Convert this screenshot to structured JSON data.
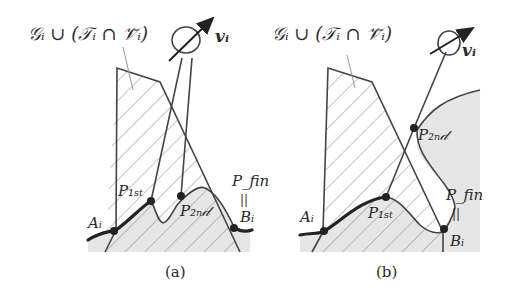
{
  "figure": {
    "panels": [
      {
        "id": "a",
        "caption": "(a)",
        "set_label": "𝒢ᵢ ∪ (𝒯ᵢ ∩ 𝒱̄ᵢ)",
        "velocity_label": "vᵢ",
        "points": {
          "A": "Aᵢ",
          "P1": "P₁ₛₜ",
          "P2": "P₂ₙ𝒹",
          "Pfin": "P_fin",
          "eq": "||",
          "B": "Bᵢ"
        }
      },
      {
        "id": "b",
        "caption": "(b)",
        "set_label": "𝒢ᵢ ∪ (𝒯ᵢ ∩ 𝒱̄ᵢ)",
        "velocity_label": "vᵢ",
        "points": {
          "A": "Aᵢ",
          "P1": "P₁ₛₜ",
          "P2": "P₂ₙ𝒹",
          "Pfin": "P_fin",
          "eq": "||",
          "B": "Bᵢ"
        }
      }
    ],
    "colors": {
      "shade": "#e4e4e4",
      "line": "#333333",
      "background": "#ffffff"
    }
  }
}
